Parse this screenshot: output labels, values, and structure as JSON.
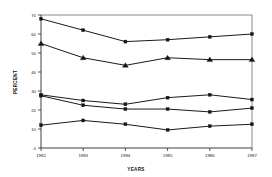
{
  "chart_data": {
    "type": "line",
    "title": "",
    "xlabel": "YEARS",
    "ylabel": "PERCENT",
    "categories": [
      "1982",
      "1983",
      "1984",
      "1985",
      "1986",
      "1987"
    ],
    "x": [
      1982,
      1983,
      1984,
      1985,
      1986,
      1987
    ],
    "xlim": [
      1982,
      1987
    ],
    "ylim": [
      0,
      70
    ],
    "yticks": [
      0,
      10,
      20,
      30,
      40,
      50,
      60,
      70
    ],
    "ytick_labels": [
      "0",
      "10",
      "20",
      "30",
      "40",
      "50",
      "60",
      "70"
    ],
    "grid": false,
    "legend": "none",
    "series": [
      {
        "name": "series-1",
        "marker": "square",
        "values": [
          68,
          62,
          56,
          57,
          58.5,
          60
        ]
      },
      {
        "name": "series-2",
        "marker": "triangle",
        "values": [
          55,
          47.5,
          43.5,
          47.5,
          46.5,
          46.5
        ]
      },
      {
        "name": "series-3",
        "marker": "square",
        "values": [
          28,
          25,
          23,
          26.5,
          28,
          25.5
        ]
      },
      {
        "name": "series-4",
        "marker": "square",
        "values": [
          27.5,
          22.5,
          20.5,
          20.5,
          19,
          21
        ]
      },
      {
        "name": "series-5",
        "marker": "square",
        "values": [
          12,
          14.5,
          12.5,
          9.5,
          11.5,
          12.5
        ]
      }
    ]
  },
  "axis": {
    "y_title": "PERCENT",
    "x_title": "YEARS"
  }
}
